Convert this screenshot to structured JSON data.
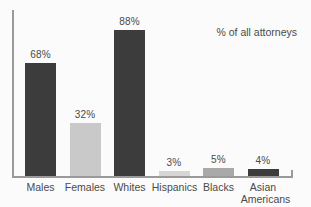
{
  "chart_data": {
    "type": "bar",
    "title": "",
    "subtitle": "",
    "xlabel": "",
    "ylabel": "",
    "ylim": [
      0,
      100
    ],
    "grid": false,
    "legend_position": "top-right",
    "legend_text": "% of all attorneys",
    "annotations": [
      "% of all attorneys"
    ],
    "categories": [
      "Males",
      "Females",
      "Whites",
      "Hispanics",
      "Blacks",
      "Asian Americans"
    ],
    "values": [
      68,
      32,
      88,
      3,
      5,
      4
    ],
    "value_labels": [
      "68%",
      "32%",
      "88%",
      "3%",
      "5%",
      "4%"
    ],
    "bar_colors": [
      "#3c3c3c",
      "#c9c9c9",
      "#3c3c3c",
      "#d6d6d6",
      "#a9a9a9",
      "#3c3c3c"
    ],
    "bars": [
      {
        "category": "Males",
        "label_line1": "Males",
        "label_line2": "",
        "value": 68,
        "value_label": "68%",
        "color": "#3c3c3c"
      },
      {
        "category": "Females",
        "label_line1": "Females",
        "label_line2": "",
        "value": 32,
        "value_label": "32%",
        "color": "#c9c9c9"
      },
      {
        "category": "Whites",
        "label_line1": "Whites",
        "label_line2": "",
        "value": 88,
        "value_label": "88%",
        "color": "#3c3c3c"
      },
      {
        "category": "Hispanics",
        "label_line1": "Hispanics",
        "label_line2": "",
        "value": 3,
        "value_label": "3%",
        "color": "#d6d6d6"
      },
      {
        "category": "Blacks",
        "label_line1": "Blacks",
        "label_line2": "",
        "value": 5,
        "value_label": "5%",
        "color": "#a9a9a9"
      },
      {
        "category": "Asian Americans",
        "label_line1": "Asian",
        "label_line2": "Americans",
        "value": 4,
        "value_label": "4%",
        "color": "#3c3c3c"
      }
    ]
  },
  "colors": {
    "background": "#fbfbfb",
    "axis": "#9a9a9a",
    "text": "#4a4a4a",
    "bar_dark": "#3c3c3c",
    "bar_medium": "#a9a9a9",
    "bar_light": "#c9c9c9",
    "bar_lightest": "#d6d6d6"
  }
}
